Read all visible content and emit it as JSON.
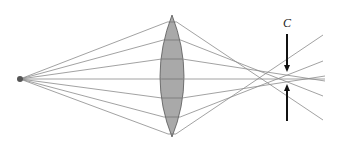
{
  "diagram": {
    "colors": {
      "ray": "#8a8a8a",
      "lens_fill": "#a9a9a9",
      "lens_stroke": "#555555",
      "arrow": "#111111",
      "source": "#555555",
      "axis": "#9a9a9a"
    },
    "source": {
      "x": 20,
      "y": 79,
      "r": 3
    },
    "lens": {
      "cx": 172,
      "cy": 77,
      "half_width": 12,
      "top": 15,
      "bottom": 137
    },
    "rays": [
      {
        "lens_y": 22,
        "end": [
          323,
          120
        ]
      },
      {
        "lens_y": 40,
        "end": [
          323,
          96
        ]
      },
      {
        "lens_y": 59,
        "end": [
          325,
          81
        ]
      },
      {
        "lens_y": 79,
        "end": [
          325,
          79
        ]
      },
      {
        "lens_y": 98,
        "end": [
          325,
          76
        ]
      },
      {
        "lens_y": 117,
        "end": [
          323,
          61
        ]
      },
      {
        "lens_y": 134,
        "end": [
          323,
          35
        ]
      }
    ],
    "marker": {
      "label": "C",
      "x": 287,
      "label_y": 23,
      "top_arrow": {
        "y1": 34,
        "y2": 72
      },
      "bottom_arrow": {
        "y1": 121,
        "y2": 84
      }
    }
  }
}
